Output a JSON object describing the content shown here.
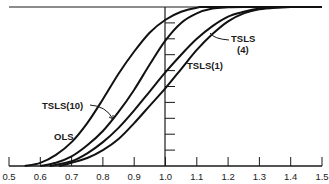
{
  "chart_data": {
    "type": "line",
    "title": "",
    "xlabel": "",
    "ylabel": "",
    "xlim": [
      0.5,
      1.5
    ],
    "ylim": [
      0,
      1
    ],
    "grid": false,
    "legend": "inline labels",
    "x_ticks": [
      "0.5",
      "0.6",
      "0.7",
      "0.8",
      "0.9",
      "1.0",
      "1.1",
      "1.2",
      "1.3",
      "1.4",
      "1.5"
    ],
    "y_ticks_count": 10,
    "vertical_reference_line": 1.0,
    "upper_bound_line": 1.0,
    "series": [
      {
        "name": "OLS",
        "x": [
          0.55,
          0.6,
          0.65,
          0.7,
          0.75,
          0.8,
          0.85,
          0.9,
          0.95,
          1.0,
          1.05,
          1.1,
          1.15
        ],
        "values": [
          0.0,
          0.02,
          0.07,
          0.15,
          0.27,
          0.42,
          0.58,
          0.72,
          0.84,
          0.92,
          0.97,
          0.995,
          1.0
        ]
      },
      {
        "name": "TSLS(10)",
        "x": [
          0.6,
          0.65,
          0.7,
          0.75,
          0.8,
          0.85,
          0.9,
          0.95,
          1.0,
          1.05,
          1.1,
          1.15,
          1.2,
          1.25
        ],
        "values": [
          0.0,
          0.02,
          0.06,
          0.13,
          0.22,
          0.34,
          0.48,
          0.64,
          0.79,
          0.9,
          0.96,
          0.99,
          0.998,
          1.0
        ]
      },
      {
        "name": "TSLS(4)",
        "x": [
          0.63,
          0.7,
          0.75,
          0.8,
          0.85,
          0.9,
          0.95,
          1.0,
          1.05,
          1.1,
          1.15,
          1.2,
          1.25,
          1.3,
          1.35,
          1.4
        ],
        "values": [
          0.0,
          0.03,
          0.08,
          0.15,
          0.24,
          0.35,
          0.47,
          0.59,
          0.7,
          0.8,
          0.88,
          0.94,
          0.97,
          0.99,
          0.997,
          1.0
        ]
      },
      {
        "name": "TSLS(1)",
        "x": [
          0.66,
          0.7,
          0.75,
          0.8,
          0.85,
          0.9,
          0.95,
          1.0,
          1.05,
          1.1,
          1.15,
          1.2,
          1.25,
          1.3,
          1.35,
          1.4
        ],
        "values": [
          0.0,
          0.02,
          0.05,
          0.1,
          0.17,
          0.27,
          0.38,
          0.49,
          0.61,
          0.73,
          0.83,
          0.91,
          0.96,
          0.985,
          0.996,
          1.0
        ]
      }
    ],
    "annotations": [
      {
        "text": "OLS",
        "x": 0.72,
        "y": 0.18
      },
      {
        "text": "TSLS(10)",
        "x": 0.63,
        "y": 0.37,
        "arrow_to": [
          0.86,
          0.28
        ]
      },
      {
        "text": "TSLS",
        "x": 1.22,
        "y": 0.81,
        "arrow_to": [
          1.12,
          0.85
        ]
      },
      {
        "text": "(4)",
        "x": 1.24,
        "y": 0.74
      },
      {
        "text": "TSLS(1)",
        "x": 1.13,
        "y": 0.55
      }
    ]
  },
  "labels": {
    "ols": "OLS",
    "tsls10": "TSLS(10)",
    "tsls4_line1": "TSLS",
    "tsls4_line2": "(4)",
    "tsls1": "TSLS(1)"
  }
}
